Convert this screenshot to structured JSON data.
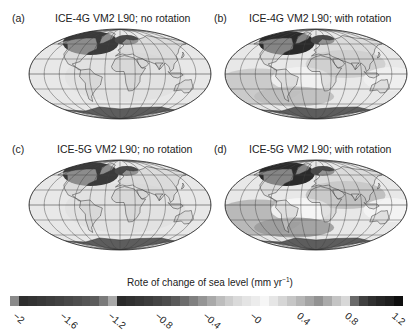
{
  "figure": {
    "panels": [
      {
        "label": "(a)",
        "title": "ICE-4G VM2 L90; no rotation",
        "rotation": false,
        "model": "ICE-4G"
      },
      {
        "label": "(b)",
        "title": "ICE-4G VM2 L90; with rotation",
        "rotation": true,
        "model": "ICE-4G"
      },
      {
        "label": "(c)",
        "title": "ICE-5G VM2 L90; no rotation",
        "rotation": false,
        "model": "ICE-5G"
      },
      {
        "label": "(d)",
        "title": "ICE-5G VM2 L90; with rotation",
        "rotation": true,
        "model": "ICE-5G"
      }
    ],
    "colorbar": {
      "title_main": "Rote of change of sea level (mm yr",
      "title_sup": "−1",
      "title_end": ")",
      "min": -2.0,
      "max": 1.2,
      "step": 0.08,
      "tick_labels": [
        "-2",
        "-1.6",
        "-1.2",
        "-0.8",
        "-0.4",
        "-0",
        "0.4",
        "0.8",
        "1.2"
      ],
      "cell_grays": [
        "#8a8a8a",
        "#2e2e2e",
        "#333333",
        "#383838",
        "#3d3d3d",
        "#424242",
        "#484848",
        "#4e4e4e",
        "#555555",
        "#5c5c5c",
        "#7a7a7a",
        "#a8a8a8",
        "#2a2a2a",
        "#303030",
        "#363636",
        "#3c3c3c",
        "#444444",
        "#4c4c4c",
        "#5a5a5a",
        "#6c6c6c",
        "#808080",
        "#959595",
        "#a9a9a9",
        "#bdbdbd",
        "#cdcdcd",
        "#dadada",
        "#e4e4e4",
        "#ececec",
        "#f6f6f6",
        "#e6e6e6",
        "#d6d6d6",
        "#c6c6c6",
        "#b6b6b6",
        "#a4a4a4",
        "#929292",
        "#aaaaaa",
        "#c4c4c4",
        "#d8d8d8",
        "#6a6a6a",
        "#404040",
        "#303030",
        "#262626",
        "#1e1e1e",
        "#0e0e0e"
      ]
    }
  },
  "chart_data": {
    "type": "heatmap",
    "subplots": [
      {
        "label": "(a)",
        "title": "ICE-4G VM2 L90; no rotation"
      },
      {
        "label": "(b)",
        "title": "ICE-4G VM2 L90; with rotation"
      },
      {
        "label": "(c)",
        "title": "ICE-5G VM2 L90; no rotation"
      },
      {
        "label": "(d)",
        "title": "ICE-5G VM2 L90; with rotation"
      }
    ],
    "colorbar_label": "Rote of change of sea level (mm yr−1)",
    "colorbar_range": [
      -2.0,
      1.2
    ],
    "colorbar_ticks": [
      -2,
      -1.6,
      -1.2,
      -0.8,
      -0.4,
      0,
      0.4,
      0.8,
      1.2
    ],
    "projection": "Mollweide",
    "grid": true
  }
}
